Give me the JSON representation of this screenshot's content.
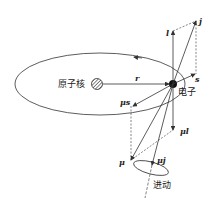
{
  "diagram": {
    "title": "",
    "labels": {
      "nucleus": "原子核",
      "electron": "电子",
      "precession": "进动",
      "r": "r",
      "l": "l",
      "j": "j",
      "s": "s",
      "mu_s": "μs",
      "mu_l": "μl",
      "mu": "μ",
      "mu_j": "μj"
    },
    "colors": {
      "line": "#333333",
      "background": "#ffffff"
    }
  }
}
